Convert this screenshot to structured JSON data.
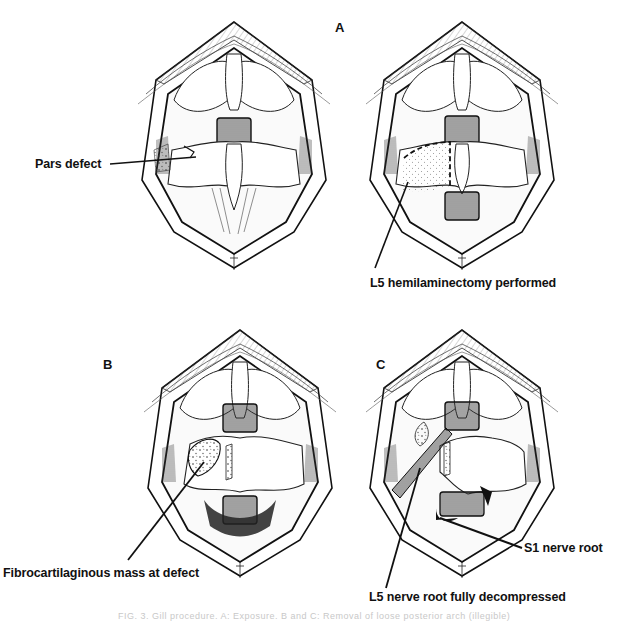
{
  "figure": {
    "panels": [
      {
        "id": "A",
        "letter": "A",
        "description": "Exposure showing intact laminae with pars defect"
      },
      {
        "id": "A2",
        "letter": "",
        "description": "L5 hemilaminectomy region outlined"
      },
      {
        "id": "B",
        "letter": "B",
        "description": "Fibrocartilaginous mass at defect exposed"
      },
      {
        "id": "C",
        "letter": "C",
        "description": "L5 nerve root decompressed, S1 root visible"
      }
    ],
    "labels": {
      "pars_defect": "Pars defect",
      "hemilaminectomy": "L5 hemilaminectomy performed",
      "fibrocartilaginous": "Fibrocartilaginous mass at defect",
      "s1_root": "S1 nerve root",
      "l5_root": "L5 nerve root fully decompressed"
    },
    "caption": "FIG. 3.  Gill procedure. A: Exposure. B and C: Removal of loose posterior arch (illegible)",
    "colors": {
      "ink": "#111111",
      "paper": "#ffffff",
      "shade": "#cfcfcf"
    }
  }
}
